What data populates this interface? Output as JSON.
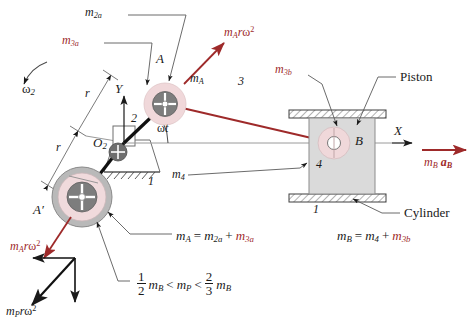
{
  "figure": {
    "title_hidden": "Slider-crank mass balancing diagram",
    "colors": {
      "red": "#9e2a2a",
      "pink_halo": "#f0d7d9",
      "pink_ring": "#f2dcdd",
      "gray_disc": "#7d7d7d",
      "gray_ring": "#b8b8b8",
      "piston_fill": "#d9d9d9",
      "leader": "#555555",
      "axis": "#808080"
    }
  },
  "labels": {
    "omega2": "ω",
    "omega2_sub": "2",
    "m2a": "m",
    "m2a_sub": "2a",
    "m3a": "m",
    "m3a_sub": "3a",
    "m3b": "m",
    "m3b_sub": "3b",
    "m4": "m",
    "m4_sub": "4",
    "mA": "m",
    "mA_sub": "A",
    "point_A": "A",
    "point_A_prime": "A′",
    "point_B": "B",
    "point_O2": "O",
    "point_O2_sub": "2",
    "link2": "2",
    "link3": "3",
    "link4": "4",
    "ground1_left": "1",
    "ground1_right": "1",
    "r_upper": "r",
    "r_lower": "r",
    "axis_Y": "Y",
    "axis_X": "X",
    "omega_t": "ωt",
    "piston": "Piston",
    "cylinder": "Cylinder"
  },
  "vectors": {
    "mArw2_top": {
      "m": "m",
      "sub": "A",
      "r": "r",
      "omega": "ω",
      "exp": "2"
    },
    "mArw2_bottom": {
      "m": "m",
      "sub": "A",
      "r": "r",
      "omega": "ω",
      "exp": "2"
    },
    "mPrw2": {
      "m": "m",
      "sub": "P",
      "r": "r",
      "omega": "ω",
      "exp": "2"
    },
    "mBaB": {
      "m": "m",
      "sub": "B",
      "a": "a",
      "a_sub": "B"
    }
  },
  "equations": {
    "mass_A": {
      "lhs_m": "m",
      "lhs_sub": "A",
      "eq": "=",
      "t1_m": "m",
      "t1_sub": "2a",
      "plus": "+",
      "t2_m": "m",
      "t2_sub": "3a"
    },
    "mass_B": {
      "lhs_m": "m",
      "lhs_sub": "B",
      "eq": "=",
      "t1_m": "m",
      "t1_sub": "4",
      "plus": "+",
      "t2_m": "m",
      "t2_sub": "3b"
    },
    "inequality": {
      "f1_num": "1",
      "f1_den": "2",
      "m1": "m",
      "m1_sub": "B",
      "lt1": "<",
      "mp": "m",
      "mp_sub": "P",
      "lt2": "<",
      "f2_num": "2",
      "f2_den": "3",
      "m2": "m",
      "m2_sub": "B"
    }
  }
}
